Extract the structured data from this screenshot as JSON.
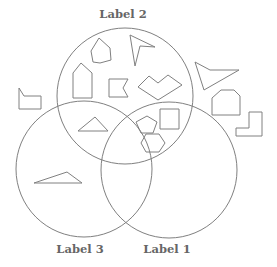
{
  "diagram": {
    "type": "venn",
    "stroke_color": "#808080",
    "label_color": "#666666",
    "sets": [
      {
        "id": "set-2",
        "label": "Label 2",
        "cx": 125,
        "cy": 96,
        "r": 68,
        "label_x": 123,
        "label_y": 7
      },
      {
        "id": "set-3",
        "label": "Label 3",
        "cx": 84,
        "cy": 169,
        "r": 68,
        "label_x": 80,
        "label_y": 242
      },
      {
        "id": "set-1",
        "label": "Label 1",
        "cx": 169,
        "cy": 170,
        "r": 68,
        "label_x": 167,
        "label_y": 242
      }
    ],
    "shapes": [
      {
        "name": "heptagon",
        "region": "Label 2 only",
        "points": "99,38 110,48 111,60 100,63 93,62 91,51"
      },
      {
        "name": "arrowhead",
        "region": "Label 2 only",
        "points": "130,35 155,47 140,46 135,66"
      },
      {
        "name": "house-pentagon",
        "region": "Label 2 only",
        "points": "81,63 73,73 73,98 92,98 92,73"
      },
      {
        "name": "notched-flag",
        "region": "Label 2 only",
        "points": "109,79 128,79 123,88 128,97 109,97"
      },
      {
        "name": "chevron-hexagon",
        "region": "Label 2 only",
        "points": "138,87 149,76 158,83 168,75 182,85 158,100"
      },
      {
        "name": "triangle-small",
        "region": "Label 2 and Label 3",
        "points": "78,131 95,117 108,131"
      },
      {
        "name": "pentagon",
        "region": "Label 2 and Label 1",
        "points": "147,116 157,122 153,133 141,133 136,122"
      },
      {
        "name": "square",
        "region": "Label 2 and Label 1",
        "points": "160,109 179,109 179,129 160,129"
      },
      {
        "name": "hexagon",
        "region": "Label 2 and Label 1",
        "points": "146,134 159,134 165,143 159,152 146,152 141,143"
      },
      {
        "name": "triangle-obtuse",
        "region": "Label 3 only",
        "points": "34,183 67,172 82,183"
      },
      {
        "name": "flag-pentagon",
        "region": "outside",
        "points": "19,88 24,96 41,96 41,109 19,109"
      },
      {
        "name": "kite-arrow",
        "region": "outside",
        "points": "195,62 210,70 239,70 204,90"
      },
      {
        "name": "cut-hexagon",
        "region": "outside",
        "points": "212,98 221,90 234,90 240,96 240,115 212,115"
      },
      {
        "name": "l-shape",
        "region": "outside",
        "points": "249,112 262,112 262,136 236,136 236,128 249,128"
      }
    ]
  }
}
